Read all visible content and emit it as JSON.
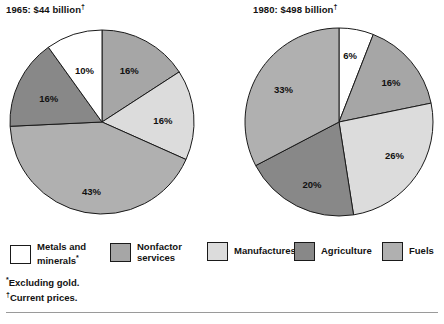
{
  "colors": {
    "metals": "#ffffff",
    "nonfactor": "#a6a6a6",
    "manufactures": "#dcdcdc",
    "agriculture": "#888888",
    "fuels": "#b0b0b0",
    "outline": "#1a1a1a",
    "text": "#121212"
  },
  "legend": {
    "items": [
      {
        "name": "legend-item-metals",
        "label": "Metals and\nminerals",
        "mark": "*",
        "color_key": "metals",
        "x": 10
      },
      {
        "name": "legend-item-nonfactor",
        "label": "Nonfactor\nservices",
        "mark": "",
        "color_key": "nonfactor",
        "x": 110
      },
      {
        "name": "legend-item-manufactures",
        "label": "Manufactures",
        "mark": "",
        "color_key": "manufactures",
        "x": 207
      },
      {
        "name": "legend-item-agriculture",
        "label": "Agriculture",
        "mark": "",
        "color_key": "agriculture",
        "x": 294
      },
      {
        "name": "legend-item-fuels",
        "label": "Fuels",
        "mark": "",
        "color_key": "fuels",
        "x": 382
      }
    ]
  },
  "footnotes": [
    {
      "mark": "*",
      "text": "Excluding gold."
    },
    {
      "mark": "†",
      "text": "Current prices."
    }
  ],
  "clipped_caption": "",
  "chart_data": [
    {
      "type": "pie",
      "id": "pie-1965",
      "title": "1965: $44 billion",
      "title_mark": "†",
      "year": "1965",
      "total_label": "$44 billion",
      "cx": 94,
      "cy": 96,
      "r": 92,
      "start_angle": 0,
      "label_radius_frac": 0.62,
      "categories": [
        "Nonfactor services",
        "Manufactures",
        "Fuels",
        "Agriculture",
        "Metals and minerals"
      ],
      "values": [
        16,
        16,
        43,
        16,
        10
      ],
      "labels": [
        "16%",
        "16%",
        "43%",
        "16%",
        "10%"
      ],
      "color_keys": [
        "nonfactor",
        "manufactures",
        "fuels",
        "agriculture",
        "metals"
      ],
      "label_offsets": [
        {
          "dx": 0,
          "dy": 0
        },
        {
          "dx": 4,
          "dy": 4
        },
        {
          "dx": 0,
          "dy": 14
        },
        {
          "dx": -2,
          "dy": 2
        },
        {
          "dx": 0,
          "dy": 4
        }
      ]
    },
    {
      "type": "pie",
      "id": "pie-1980",
      "title": "1980: $498 billion",
      "title_mark": "†",
      "year": "1980",
      "total_label": "$498 billion",
      "cx": 96,
      "cy": 96,
      "r": 94,
      "start_angle": 0,
      "label_radius_frac": 0.64,
      "categories": [
        "Metals and minerals",
        "Nonfactor services",
        "Manufactures",
        "Agriculture",
        "Fuels"
      ],
      "values": [
        6,
        16,
        26,
        20,
        33
      ],
      "labels": [
        "6%",
        "16%",
        "26%",
        "20%",
        "33%"
      ],
      "color_keys": [
        "metals",
        "nonfactor",
        "manufactures",
        "agriculture",
        "fuels"
      ],
      "label_offsets": [
        {
          "dx": 0,
          "dy": -6
        },
        {
          "dx": 6,
          "dy": 0
        },
        {
          "dx": 6,
          "dy": 0
        },
        {
          "dx": 0,
          "dy": 10
        },
        {
          "dx": -4,
          "dy": 0
        }
      ]
    }
  ]
}
